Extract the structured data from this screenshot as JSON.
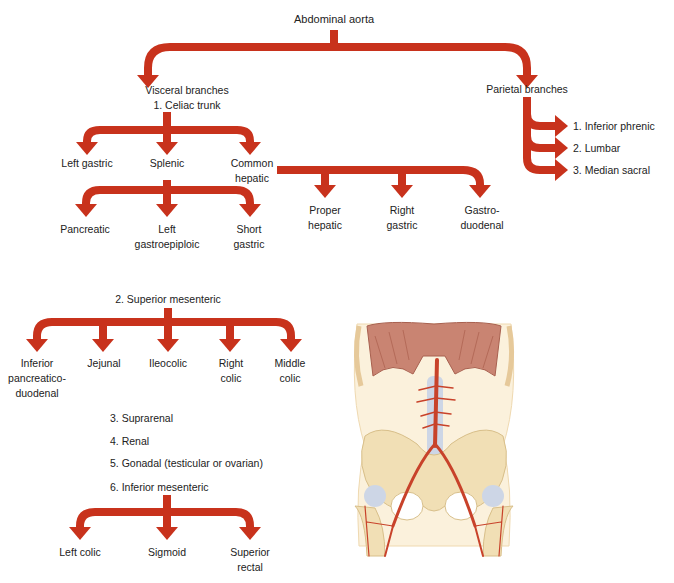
{
  "colors": {
    "arrow": "#c8321c",
    "arrow_edge": "#a5260f",
    "text": "#222222",
    "background": "#ffffff"
  },
  "root": {
    "label": "Abdominal aorta"
  },
  "visceral": {
    "heading": "Visceral branches",
    "celiac": {
      "label": "1. Celiac trunk",
      "branches": [
        {
          "lines": [
            "Left gastric"
          ]
        },
        {
          "lines": [
            "Splenic"
          ]
        },
        {
          "lines": [
            "Common",
            "hepatic"
          ]
        }
      ],
      "splenic_branches": [
        {
          "lines": [
            "Pancreatic"
          ]
        },
        {
          "lines": [
            "Left",
            "gastroepiploic"
          ]
        },
        {
          "lines": [
            "Short",
            "gastric"
          ]
        }
      ],
      "common_hepatic_branches": [
        {
          "lines": [
            "Proper",
            "hepatic"
          ]
        },
        {
          "lines": [
            "Right",
            "gastric"
          ]
        },
        {
          "lines": [
            "Gastro-",
            "duodenal"
          ]
        }
      ]
    },
    "superior_mesenteric": {
      "label": "2. Superior mesenteric",
      "branches": [
        {
          "lines": [
            "Inferior",
            "pancreatico-",
            "duodenal"
          ]
        },
        {
          "lines": [
            "Jejunal"
          ]
        },
        {
          "lines": [
            "Ileocolic"
          ]
        },
        {
          "lines": [
            "Right",
            "colic"
          ]
        },
        {
          "lines": [
            "Middle",
            "colic"
          ]
        }
      ]
    },
    "list": [
      "3. Suprarenal",
      "4. Renal",
      "5. Gonadal (testicular or ovarian)",
      "6. Inferior mesenteric"
    ],
    "inferior_mesenteric": {
      "branches": [
        {
          "lines": [
            "Left colic"
          ]
        },
        {
          "lines": [
            "Sigmoid"
          ]
        },
        {
          "lines": [
            "Superior",
            "rectal"
          ]
        }
      ]
    }
  },
  "parietal": {
    "heading": "Parietal branches",
    "branches": [
      "1. Inferior phrenic",
      "2. Lumbar",
      "3. Median sacral"
    ]
  },
  "illustration": {
    "subject": "anterior-view-abdominal-aorta-anatomy"
  }
}
